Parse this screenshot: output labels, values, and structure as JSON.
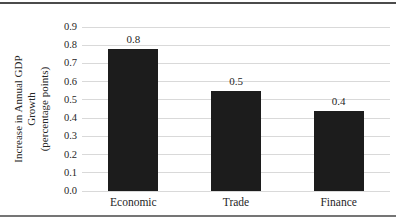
{
  "chart_data": {
    "type": "bar",
    "categories": [
      "Economic",
      "Trade",
      "Finance"
    ],
    "values": [
      0.8,
      0.5,
      0.4
    ],
    "values_as_drawn": [
      0.78,
      0.55,
      0.44
    ],
    "data_labels": [
      "0.8",
      "0.5",
      "0.4"
    ],
    "ylabel": "Increase in Annual GDP Growth (percentage points)",
    "ylabel_lines": [
      "Increase in Annual GDP",
      "Growth",
      "(percentage points)"
    ],
    "ylim": [
      0.0,
      0.9
    ],
    "ytick_step": 0.1,
    "yticks": [
      "0.0",
      "0.1",
      "0.2",
      "0.3",
      "0.4",
      "0.5",
      "0.6",
      "0.7",
      "0.8",
      "0.9"
    ],
    "grid": true,
    "legend": "none",
    "colors": {
      "bar": "#1c1c1c",
      "gridline": "#d9d9d9",
      "text": "#262626",
      "top_rule": "#4b4b4b",
      "bottom_rule": "#757575",
      "background": "#ffffff"
    }
  }
}
